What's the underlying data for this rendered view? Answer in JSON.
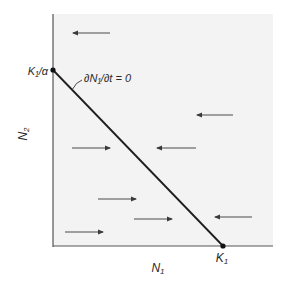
{
  "diagram": {
    "type": "phase-plane-isocline",
    "xlabel": "N",
    "xlabel_sub": "1",
    "ylabel": "N",
    "ylabel_sub": "2",
    "isocline_label": "∂N₁/∂t = 0",
    "y_intercept_label": "K₁/α",
    "x_intercept_label": "K",
    "x_intercept_sub": "1",
    "colors": {
      "background": "#f3f3f3",
      "line": "#1e1e1e",
      "arrow": "#4a4a4a",
      "text": "#2b2b2b"
    },
    "arrows": [
      {
        "x1": 110,
        "x2": 73,
        "y": 33,
        "direction": "left"
      },
      {
        "x1": 233,
        "x2": 197,
        "y": 115,
        "direction": "left"
      },
      {
        "x1": 72,
        "x2": 110,
        "y": 148,
        "direction": "right"
      },
      {
        "x1": 196,
        "x2": 157,
        "y": 148,
        "direction": "left"
      },
      {
        "x1": 98,
        "x2": 136,
        "y": 199,
        "direction": "right"
      },
      {
        "x1": 134,
        "x2": 172,
        "y": 219,
        "direction": "right"
      },
      {
        "x1": 252,
        "x2": 215,
        "y": 217,
        "direction": "left"
      },
      {
        "x1": 65,
        "x2": 103,
        "y": 232,
        "direction": "right"
      }
    ]
  }
}
